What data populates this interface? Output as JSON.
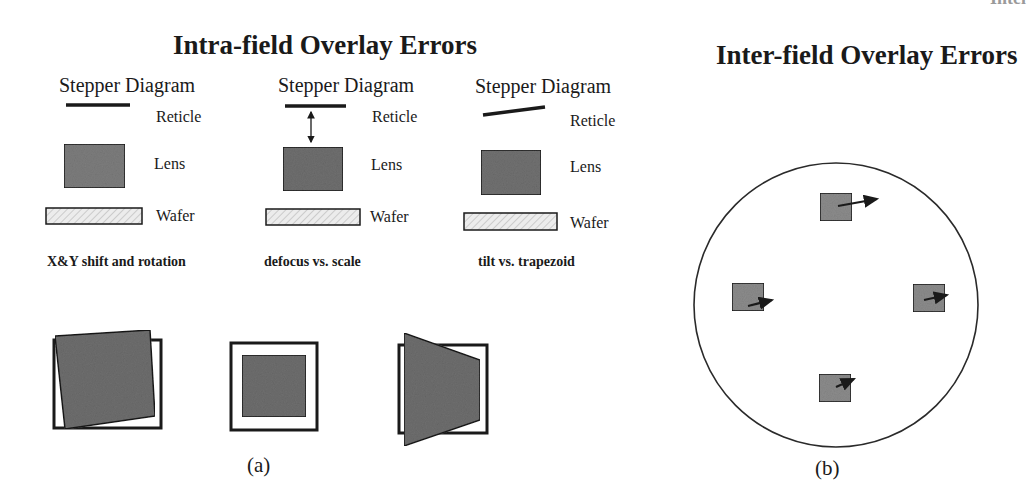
{
  "header": {
    "corner_text": "Intel"
  },
  "panel_a": {
    "title": "Intra-field Overlay Errors",
    "label": "(a)",
    "columns": [
      {
        "heading": "Stepper Diagram",
        "reticle_label": "Reticle",
        "lens_label": "Lens",
        "wafer_label": "Wafer",
        "caption": "X&Y shift and rotation",
        "reticle_state": "flat",
        "has_focus_arrow": false,
        "overlay_type": "rotation"
      },
      {
        "heading": "Stepper Diagram",
        "reticle_label": "Reticle",
        "lens_label": "Lens",
        "wafer_label": "Wafer",
        "caption": "defocus vs. scale",
        "reticle_state": "flat",
        "has_focus_arrow": true,
        "overlay_type": "scale"
      },
      {
        "heading": "Stepper Diagram",
        "reticle_label": "Reticle",
        "lens_label": "Lens",
        "wafer_label": "Wafer",
        "caption": "tilt vs. trapezoid",
        "reticle_state": "tilted",
        "has_focus_arrow": false,
        "overlay_type": "trapezoid"
      }
    ]
  },
  "panel_b": {
    "title": "Inter-field Overlay Errors",
    "label": "(b)",
    "fields": [
      {
        "position": "top",
        "vector": "right, slightly up"
      },
      {
        "position": "left",
        "vector": "right, slightly up"
      },
      {
        "position": "right",
        "vector": "right, slightly up"
      },
      {
        "position": "bottom",
        "vector": "up-right, short"
      }
    ]
  },
  "colors": {
    "ink": "#1a1a1a",
    "lens_fill": "#7d7d7d",
    "wafer_fill": "#e6e6e6",
    "field_fill": "#8c8c8c"
  }
}
